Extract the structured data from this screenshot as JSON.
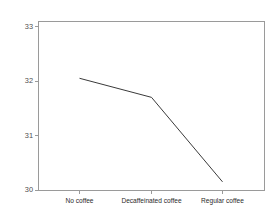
{
  "chart_data": {
    "type": "line",
    "title": "",
    "subtitle": "",
    "xlabel": "",
    "ylabel": "",
    "categories": [
      "No coffee",
      "Decaffeinated coffee",
      "Regular coffee"
    ],
    "values": [
      32.05,
      31.7,
      30.15
    ],
    "series": [
      {
        "name": "",
        "values": [
          32.05,
          31.7,
          30.15
        ]
      }
    ],
    "ylim": [
      29.7,
      33.2
    ],
    "yticks": [
      30,
      31,
      32,
      33
    ],
    "ytick_labels": [
      "30",
      "31",
      "32",
      "33"
    ],
    "grid": false,
    "legend": false,
    "legend_position": "none",
    "annotations": [],
    "colors": {
      "line": "#3a3a3a",
      "frame": "#9a9a9a",
      "background": "#ffffff",
      "tick_label": "#4d4d4d",
      "category_label": "#2b2b2b"
    }
  },
  "axis": {
    "y_tick_0": "30",
    "y_tick_1": "31",
    "y_tick_2": "32",
    "y_tick_3": "33",
    "x_cat_0": "No coffee",
    "x_cat_1": "Decaffeinated coffee",
    "x_cat_2": "Regular coffee"
  }
}
